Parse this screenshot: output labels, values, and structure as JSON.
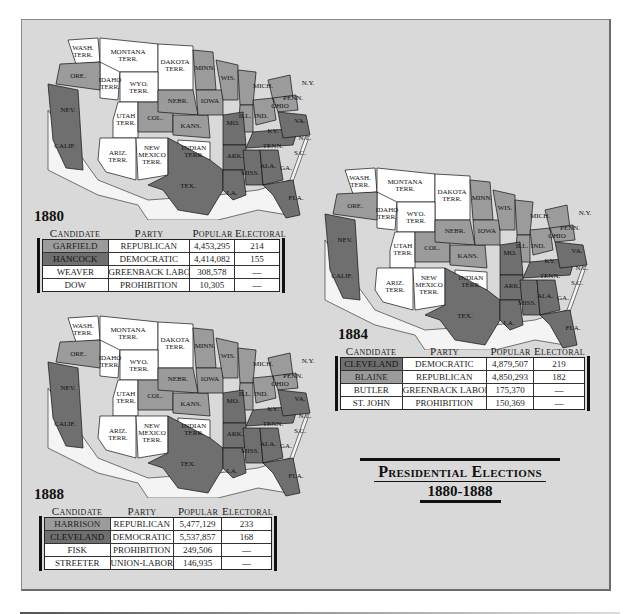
{
  "title": {
    "line1": "Presidential Elections",
    "line2": "1880-1888"
  },
  "colors": {
    "background": "#d9d9d9",
    "republican_fill": "#9b9b9b",
    "democratic_fill": "#6f6f6f",
    "territory_fill": "#ffffff"
  },
  "columns": {
    "candidate": "Candidate",
    "party": "Party",
    "popular": "Popular",
    "electoral": "Electoral"
  },
  "elections": [
    {
      "year": "1880",
      "rows": [
        {
          "candidate": "GARFIELD",
          "party": "REPUBLICAN",
          "popular": "4,453,295",
          "electoral": "214",
          "shade": "rep"
        },
        {
          "candidate": "HANCOCK",
          "party": "DEMOCRATIC",
          "popular": "4,414,082",
          "electoral": "155",
          "shade": "dem"
        },
        {
          "candidate": "WEAVER",
          "party": "GREENBACK LABOR",
          "popular": "308,578",
          "electoral": "—",
          "shade": "none"
        },
        {
          "candidate": "DOW",
          "party": "PROHIBITION",
          "popular": "10,305",
          "electoral": "—",
          "shade": "none"
        }
      ]
    },
    {
      "year": "1884",
      "rows": [
        {
          "candidate": "CLEVELAND",
          "party": "DEMOCRATIC",
          "popular": "4,879,507",
          "electoral": "219",
          "shade": "dem"
        },
        {
          "candidate": "BLAINE",
          "party": "REPUBLICAN",
          "popular": "4,850,293",
          "electoral": "182",
          "shade": "rep"
        },
        {
          "candidate": "BUTLER",
          "party": "GREENBACK LABOR",
          "popular": "175,370",
          "electoral": "—",
          "shade": "none"
        },
        {
          "candidate": "ST. JOHN",
          "party": "PROHIBITION",
          "popular": "150,369",
          "electoral": "—",
          "shade": "none"
        }
      ]
    },
    {
      "year": "1888",
      "rows": [
        {
          "candidate": "HARRISON",
          "party": "REPUBLICAN",
          "popular": "5,477,129",
          "electoral": "233",
          "shade": "rep"
        },
        {
          "candidate": "CLEVELAND",
          "party": "DEMOCRATIC",
          "popular": "5,537,857",
          "electoral": "168",
          "shade": "dem"
        },
        {
          "candidate": "FISK",
          "party": "PROHIBITION",
          "popular": "249,506",
          "electoral": "—",
          "shade": "none"
        },
        {
          "candidate": "STREETER",
          "party": "UNION-LABOR",
          "popular": "146,935",
          "electoral": "—",
          "shade": "none"
        }
      ]
    }
  ],
  "map_labels": [
    "WASH. TERR.",
    "MONTANA TERR.",
    "DAKOTA TERR.",
    "IDAHO TERR.",
    "WYO. TERR.",
    "ORE.",
    "NEV.",
    "UTAH TERR.",
    "COL.",
    "NEBR.",
    "KANS.",
    "CALIF.",
    "ARIZ. TERR.",
    "NEW MEXICO TERR.",
    "INDIAN TERR.",
    "TEX.",
    "MINN.",
    "IOWA",
    "MO.",
    "ARK.",
    "LA.",
    "WIS.",
    "ILL.",
    "MICH.",
    "IND.",
    "OHIO",
    "KY.",
    "TENN.",
    "MISS.",
    "ALA.",
    "GA.",
    "FLA.",
    "S.C.",
    "N.C.",
    "VA.",
    "W. VA.",
    "PENN.",
    "N.Y.",
    "N.H.",
    "VT.",
    "ME.",
    "MASS.",
    "R.I.",
    "CONN.",
    "N.J.",
    "DEL.",
    "MD."
  ]
}
